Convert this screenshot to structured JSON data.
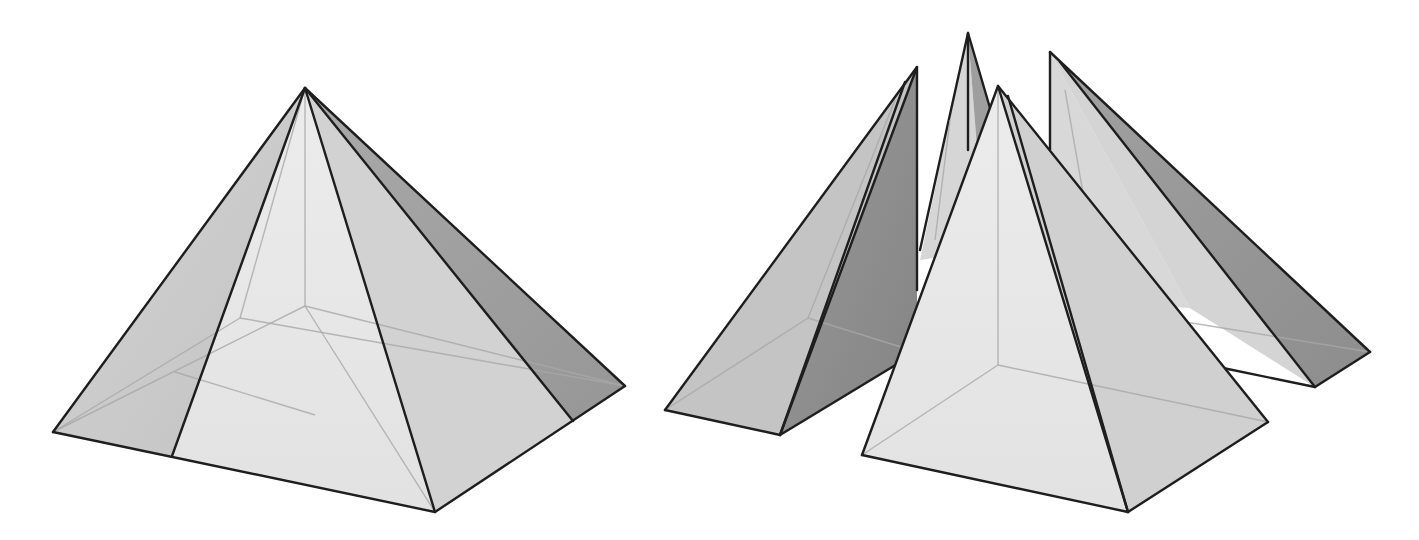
{
  "figure": {
    "colors": {
      "background": "#ffffff",
      "light_face": "#e6e6e6",
      "mid_face": "#c9c9c9",
      "dark_face": "#8c8c8c",
      "edge": "#1e1e1e",
      "hidden_edge": "#a8a8a8"
    },
    "left_pyramid": {
      "label": "whole-pyramid",
      "apex": [
        305,
        88
      ],
      "base": [
        [
          53,
          432
        ],
        [
          435,
          512
        ],
        [
          625,
          386
        ],
        [
          240,
          318
        ]
      ]
    },
    "right_group": {
      "label": "decomposed-pyramid",
      "pieces": [
        {
          "name": "front-piece",
          "apex": [
            998,
            86
          ]
        },
        {
          "name": "left-piece",
          "apex": [
            917,
            67
          ]
        },
        {
          "name": "back-piece",
          "apex": [
            968,
            33
          ]
        },
        {
          "name": "right-piece",
          "apex": [
            1050,
            52
          ]
        }
      ]
    }
  }
}
